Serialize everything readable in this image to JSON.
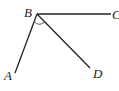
{
  "diagram": {
    "type": "angle-figure",
    "points": {
      "A": {
        "label": "A",
        "x": 15,
        "y": 73
      },
      "B": {
        "label": "B",
        "x": 37,
        "y": 14
      },
      "C": {
        "label": "C",
        "x": 110,
        "y": 14
      },
      "D": {
        "label": "D",
        "x": 90,
        "y": 68
      }
    },
    "segments": [
      "BA",
      "BC",
      "BD"
    ],
    "marked_angle": "ABD",
    "stroke_color": "#222222"
  }
}
